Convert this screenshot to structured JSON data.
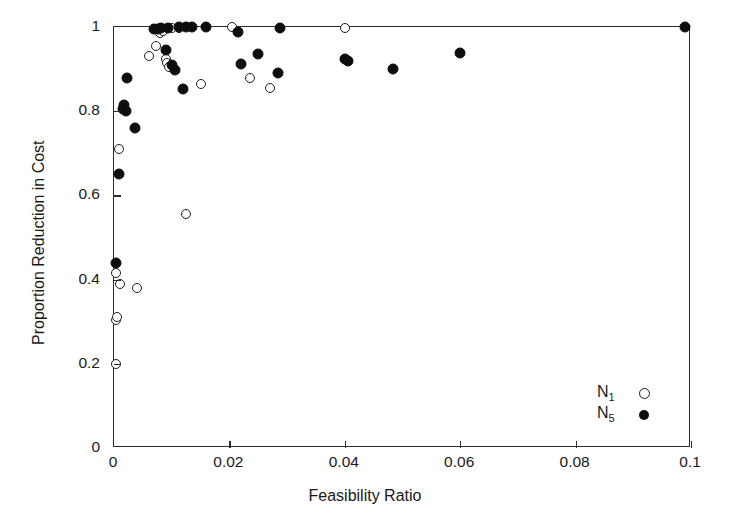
{
  "chart_data": {
    "type": "scatter",
    "title": "",
    "xlabel": "Feasibility Ratio",
    "ylabel": "Proportion Reduction in Cost",
    "xlim": [
      0,
      0.1
    ],
    "ylim": [
      0,
      1
    ],
    "xticks": [
      0,
      0.02,
      0.04,
      0.06,
      0.08,
      0.1
    ],
    "xticklabels": [
      "0",
      "0.02",
      "0.04",
      "0.06",
      "0.08",
      "0.1"
    ],
    "yticks": [
      0,
      0.2,
      0.4,
      0.6,
      0.8,
      1
    ],
    "yticklabels": [
      "0",
      "0.2",
      "0.4",
      "0.6",
      "0.8",
      "1"
    ],
    "grid": false,
    "legend_position": "bottom-right",
    "series": [
      {
        "name": "N1",
        "label_base": "N",
        "label_sub": "1",
        "marker": "open-circle",
        "color": "#1d1d1d",
        "points": [
          [
            0.0004,
            0.2
          ],
          [
            0.0004,
            0.305
          ],
          [
            0.0006,
            0.31
          ],
          [
            0.0004,
            0.415
          ],
          [
            0.001,
            0.39
          ],
          [
            0.0009,
            0.71
          ],
          [
            0.004,
            0.38
          ],
          [
            0.006,
            0.93
          ],
          [
            0.0072,
            0.955
          ],
          [
            0.008,
            0.985
          ],
          [
            0.0085,
            0.99
          ],
          [
            0.009,
            0.925
          ],
          [
            0.0092,
            0.915
          ],
          [
            0.0095,
            0.905
          ],
          [
            0.01,
            0.998
          ],
          [
            0.0112,
            0.998
          ],
          [
            0.0125,
            0.555
          ],
          [
            0.015,
            0.865
          ],
          [
            0.0205,
            0.999
          ],
          [
            0.0235,
            0.88
          ],
          [
            0.027,
            0.855
          ],
          [
            0.04,
            0.998
          ],
          [
            0.04,
            0.925
          ]
        ]
      },
      {
        "name": "N5",
        "label_base": "N",
        "label_sub": "5",
        "marker": "filled-circle",
        "color": "#0d0d0d",
        "points": [
          [
            0.0004,
            0.44
          ],
          [
            0.0008,
            0.65
          ],
          [
            0.0016,
            0.805
          ],
          [
            0.0018,
            0.815
          ],
          [
            0.002,
            0.8
          ],
          [
            0.0022,
            0.878
          ],
          [
            0.0036,
            0.76
          ],
          [
            0.007,
            0.996
          ],
          [
            0.0076,
            0.995
          ],
          [
            0.0082,
            0.998
          ],
          [
            0.009,
            0.945
          ],
          [
            0.0094,
            0.997
          ],
          [
            0.01,
            0.91
          ],
          [
            0.0105,
            0.898
          ],
          [
            0.012,
            0.852
          ],
          [
            0.0112,
            0.999
          ],
          [
            0.0125,
            0.999
          ],
          [
            0.0135,
            0.999
          ],
          [
            0.016,
            0.999
          ],
          [
            0.0215,
            0.988
          ],
          [
            0.022,
            0.912
          ],
          [
            0.025,
            0.935
          ],
          [
            0.0285,
            0.89
          ],
          [
            0.0288,
            0.998
          ],
          [
            0.04,
            0.923
          ],
          [
            0.0405,
            0.92
          ],
          [
            0.0483,
            0.9
          ],
          [
            0.06,
            0.938
          ],
          [
            0.099,
            0.999
          ]
        ]
      }
    ]
  }
}
